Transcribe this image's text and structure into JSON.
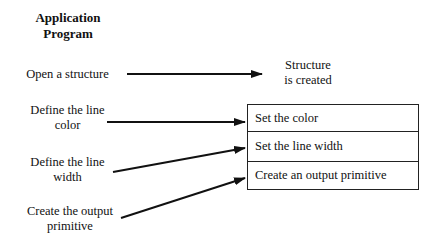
{
  "header": {
    "title_line1": "Application",
    "title_line2": "Program"
  },
  "left_steps": [
    {
      "line1": "Open a structure",
      "line2": ""
    },
    {
      "line1": "Define the line",
      "line2": "color"
    },
    {
      "line1": "Define the line",
      "line2": "width"
    },
    {
      "line1": "Create the output",
      "line2": "primitive"
    }
  ],
  "result": {
    "line1": "Structure",
    "line2": "is created"
  },
  "structure_elements": [
    "Set the color",
    "Set the line width",
    "Create an output primitive"
  ]
}
